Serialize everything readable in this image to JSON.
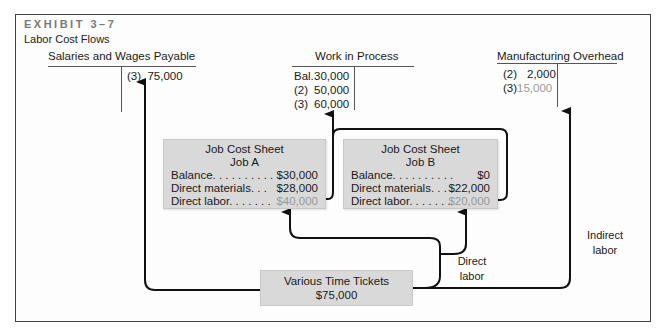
{
  "exhibit": {
    "number": "EXHIBIT 3–7",
    "title": "Labor Cost Flows"
  },
  "accounts": {
    "salaries": {
      "title": "Salaries and Wages Payable",
      "credits": [
        {
          "ref": "(3)",
          "amount": "75,000"
        }
      ]
    },
    "wip": {
      "title": "Work in Process",
      "debits": [
        {
          "ref": "Bal.",
          "amount": "30,000"
        },
        {
          "ref": "(2)",
          "amount": "50,000"
        },
        {
          "ref": "(3)",
          "amount": "60,000"
        }
      ]
    },
    "overhead": {
      "title": "Manufacturing Overhead",
      "debits": [
        {
          "ref": "(2)",
          "amount": "2,000"
        },
        {
          "ref": "(3)",
          "amount": "15,000"
        }
      ]
    }
  },
  "job_sheets": [
    {
      "title": "Job Cost Sheet",
      "job": "Job A",
      "rows": [
        {
          "label": "Balance. . . . . . . . . .",
          "value": "$30,000"
        },
        {
          "label": "Direct materials. . .",
          "value": "$28,000"
        },
        {
          "label": "Direct labor. . . . . . .",
          "value": "$40,000"
        }
      ]
    },
    {
      "title": "Job Cost Sheet",
      "job": "Job B",
      "rows": [
        {
          "label": "Balance. . . . . . . . . .",
          "value": "$0"
        },
        {
          "label": "Direct materials. . .",
          "value": "$22,000"
        },
        {
          "label": "Direct labor. . . . . . .",
          "value": "$20,000"
        }
      ]
    }
  ],
  "time_tickets": {
    "title": "Various Time Tickets",
    "amount": "$75,000"
  },
  "flow_labels": {
    "direct_labor_line1": "Direct",
    "direct_labor_line2": "labor",
    "indirect_labor_line1": "Indirect",
    "indirect_labor_line2": "labor"
  },
  "colors": {
    "box_fill": "#d9d9d9",
    "highlight_text": "#9a9a9a",
    "line": "#111111"
  }
}
